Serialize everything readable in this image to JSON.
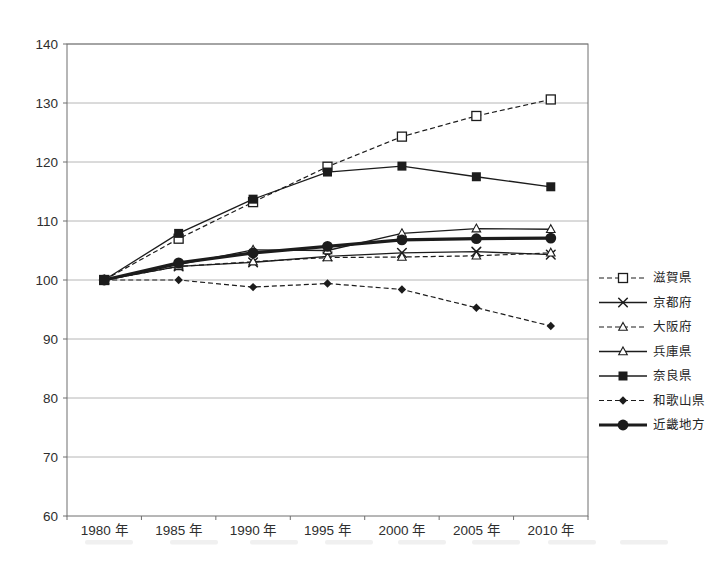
{
  "colors": {
    "ink": "#1c1c1c",
    "grid": "#a3a3a3",
    "border": "#6e6e6e",
    "text": "#2e2e2e",
    "background": "#ffffff"
  },
  "chart_data": {
    "type": "line",
    "title": "",
    "xlabel": "",
    "ylabel": "",
    "grid": true,
    "legend_position": "right",
    "ylim": [
      60,
      140
    ],
    "ytick_step": 10,
    "yticks": [
      140,
      130,
      120,
      110,
      100,
      90,
      80,
      70,
      60
    ],
    "categories": [
      "1980 年",
      "1985 年",
      "1990 年",
      "1995 年",
      "2000 年",
      "2005 年",
      "2010 年"
    ],
    "series": [
      {
        "id": "shiga",
        "name": "滋賀県",
        "values": [
          100,
          107.0,
          113.2,
          119.2,
          124.3,
          127.8,
          130.6
        ],
        "line": "dashed",
        "marker": "open-square"
      },
      {
        "id": "kyoto",
        "name": "京都府",
        "values": [
          100,
          102.3,
          103.0,
          104.0,
          104.6,
          104.8,
          104.3
        ],
        "line": "solid",
        "marker": "x"
      },
      {
        "id": "osaka",
        "name": "大阪府",
        "values": [
          100,
          102.3,
          103.1,
          103.8,
          103.9,
          104.1,
          104.6
        ],
        "line": "dashed",
        "marker": "open-triangle"
      },
      {
        "id": "hyogo",
        "name": "兵庫県",
        "values": [
          100,
          102.6,
          105.1,
          105.0,
          107.9,
          108.7,
          108.6
        ],
        "line": "solid",
        "marker": "open-triangle"
      },
      {
        "id": "nara",
        "name": "奈良県",
        "values": [
          100,
          107.9,
          113.7,
          118.3,
          119.3,
          117.5,
          115.8
        ],
        "line": "solid",
        "marker": "filled-square"
      },
      {
        "id": "wakayama",
        "name": "和歌山県",
        "values": [
          100,
          100.0,
          98.8,
          99.4,
          98.4,
          95.3,
          92.2
        ],
        "line": "dashed",
        "marker": "filled-diamond"
      },
      {
        "id": "kinki",
        "name": "近畿地方",
        "values": [
          100,
          102.9,
          104.6,
          105.7,
          106.8,
          107.0,
          107.1
        ],
        "line": "solid-thick",
        "marker": "filled-circle"
      }
    ]
  }
}
